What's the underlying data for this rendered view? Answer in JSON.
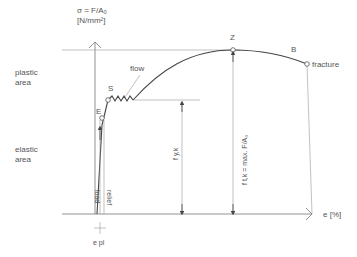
{
  "axes": {
    "y_label_line1": "σ = F/A₀",
    "y_label_line2": "[N/mm²]",
    "x_label": "e [%]"
  },
  "areas": {
    "plastic_line1": "plastic",
    "plastic_line2": "area",
    "elastic_line1": "elastic",
    "elastic_line2": "area"
  },
  "points": {
    "E": "E",
    "S": "S",
    "Z": "Z",
    "B": "B"
  },
  "annotations": {
    "flow": "flow",
    "fracture": "fracture",
    "load": "load",
    "relief": "relief",
    "f_yk": "f y,k",
    "f_tk": "f t,k = max. F/A₀",
    "e_pl": "e pl"
  },
  "colors": {
    "line": "#777777",
    "curve": "#444444",
    "text": "#555555"
  }
}
